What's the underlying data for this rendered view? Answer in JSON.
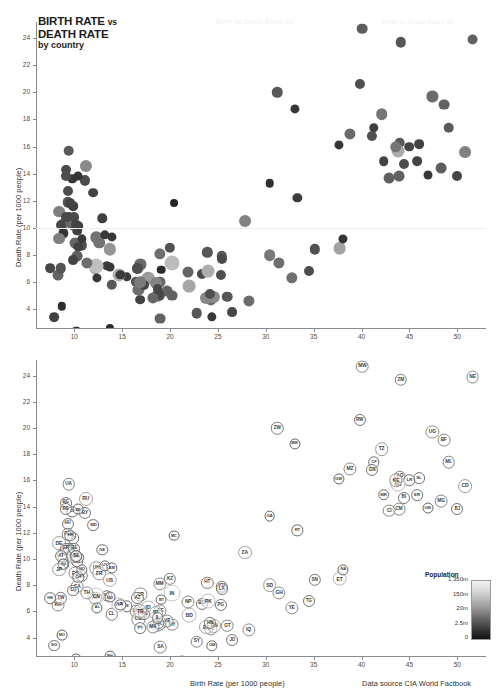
{
  "page": {
    "watermark": "Birth vs Death Rates v3"
  },
  "title": {
    "line1_main": "BIRTH RATE",
    "line1_sub": "vs",
    "line2": "DEATH RATE",
    "line3": "by country"
  },
  "source_note": "Data source CIA World Factbook",
  "axes": {
    "x_label": "Birth Rate (per 1000 people)",
    "y_label": "Death Rate (per 1000 people)",
    "x_ticks": [
      10,
      15,
      20,
      25,
      30,
      35,
      40,
      45,
      50
    ],
    "y_ticks": [
      4,
      6,
      8,
      10,
      12,
      14,
      16,
      18,
      20,
      22,
      24
    ],
    "xlim": [
      6,
      53
    ],
    "ylim": [
      2.6,
      25.2
    ]
  },
  "legend": {
    "title": "Population",
    "ticks": [
      "1,350m",
      "150m",
      "20m",
      "2.5m",
      "0"
    ]
  },
  "colors": {
    "bubble_dark": "#2b2b2b",
    "bubble_mid": "#6e6e6e",
    "bubble_light": "#bfbfbf",
    "axis": "#8a8a8a",
    "grid": "#eceff1"
  },
  "chart_data": {
    "type": "scatter",
    "xlabel": "Birth Rate (per 1000 people)",
    "ylabel": "Death Rate (per 1000 people)",
    "xlim": [
      6,
      53
    ],
    "ylim": [
      2.6,
      25.2
    ],
    "grid": false,
    "legend_position": "bottom-right",
    "size_encodes": "Population",
    "color_encodes": "Population",
    "panels": [
      {
        "name": "top-panel",
        "labels": false
      },
      {
        "name": "bottom-panel",
        "labels": true
      }
    ],
    "points": [
      {
        "code": "UA",
        "x": 9.4,
        "y": 15.7,
        "pop": 2.0
      },
      {
        "code": "RU",
        "x": 11.2,
        "y": 14.6,
        "pop": 3.6
      },
      {
        "code": "BG",
        "x": 9.1,
        "y": 14.3,
        "pop": 1.4
      },
      {
        "code": "LV",
        "x": 9.8,
        "y": 13.6,
        "pop": 1.0
      },
      {
        "code": "LT",
        "x": 9.9,
        "y": 11.6,
        "pop": 1.2
      },
      {
        "code": "BY",
        "x": 11.1,
        "y": 13.5,
        "pop": 1.6
      },
      {
        "code": "HU",
        "x": 9.3,
        "y": 12.7,
        "pop": 1.5
      },
      {
        "code": "RO",
        "x": 9.3,
        "y": 11.9,
        "pop": 1.9
      },
      {
        "code": "EE",
        "x": 10.4,
        "y": 13.8,
        "pop": 0.8
      },
      {
        "code": "RS",
        "x": 9.1,
        "y": 13.8,
        "pop": 1.6
      },
      {
        "code": "GE",
        "x": 12.9,
        "y": 10.7,
        "pop": 1.1
      },
      {
        "code": "MD",
        "x": 12.0,
        "y": 12.6,
        "pop": 1.3
      },
      {
        "code": "HR",
        "x": 9.6,
        "y": 11.8,
        "pop": 1.2
      },
      {
        "code": "BA",
        "x": 8.9,
        "y": 9.6,
        "pop": 1.1
      },
      {
        "code": "DE",
        "x": 8.4,
        "y": 11.2,
        "pop": 3.3
      },
      {
        "code": "IT",
        "x": 8.9,
        "y": 10.3,
        "pop": 3.0
      },
      {
        "code": "PT",
        "x": 9.4,
        "y": 10.8,
        "pop": 1.6
      },
      {
        "code": "GR",
        "x": 9.1,
        "y": 10.8,
        "pop": 1.6
      },
      {
        "code": "AT",
        "x": 8.6,
        "y": 10.2,
        "pop": 1.4
      },
      {
        "code": "CZ",
        "x": 9.8,
        "y": 10.3,
        "pop": 1.5
      },
      {
        "code": "SI",
        "x": 8.8,
        "y": 9.6,
        "pop": 0.8
      },
      {
        "code": "SK",
        "x": 10.3,
        "y": 9.8,
        "pop": 1.2
      },
      {
        "code": "PL",
        "x": 9.9,
        "y": 10.2,
        "pop": 2.5
      },
      {
        "code": "FI",
        "x": 10.4,
        "y": 10.1,
        "pop": 1.2
      },
      {
        "code": "BE",
        "x": 10.0,
        "y": 10.8,
        "pop": 1.4
      },
      {
        "code": "DK",
        "x": 10.2,
        "y": 10.2,
        "pop": 1.1
      },
      {
        "code": "SE",
        "x": 10.2,
        "y": 10.2,
        "pop": 1.4
      },
      {
        "code": "UK",
        "x": 12.3,
        "y": 9.3,
        "pop": 2.8
      },
      {
        "code": "FR",
        "x": 12.6,
        "y": 8.9,
        "pop": 2.9
      },
      {
        "code": "NL",
        "x": 10.8,
        "y": 8.7,
        "pop": 1.8
      },
      {
        "code": "ES",
        "x": 10.1,
        "y": 8.9,
        "pop": 2.4
      },
      {
        "code": "CH",
        "x": 10.4,
        "y": 8.6,
        "pop": 1.1
      },
      {
        "code": "NO",
        "x": 10.8,
        "y": 9.2,
        "pop": 1.0
      },
      {
        "code": "IE",
        "x": 15.5,
        "y": 6.4,
        "pop": 1.0
      },
      {
        "code": "US",
        "x": 13.7,
        "y": 8.4,
        "pop": 3.9
      },
      {
        "code": "CA",
        "x": 10.3,
        "y": 7.9,
        "pop": 2.2
      },
      {
        "code": "AU",
        "x": 12.2,
        "y": 7.0,
        "pop": 1.9
      },
      {
        "code": "NZ",
        "x": 13.4,
        "y": 7.2,
        "pop": 1.1
      },
      {
        "code": "JP",
        "x": 8.4,
        "y": 9.2,
        "pop": 3.3
      },
      {
        "code": "KR",
        "x": 8.3,
        "y": 6.5,
        "pop": 2.4
      },
      {
        "code": "TW",
        "x": 8.6,
        "y": 7.0,
        "pop": 1.9
      },
      {
        "code": "SG",
        "x": 7.9,
        "y": 3.4,
        "pop": 1.3
      },
      {
        "code": "HK",
        "x": 7.5,
        "y": 7.0,
        "pop": 1.3
      },
      {
        "code": "MO",
        "x": 8.7,
        "y": 4.2,
        "pop": 0.5
      },
      {
        "code": "CN",
        "x": 12.3,
        "y": 7.2,
        "pop": 8.0
      },
      {
        "code": "TH",
        "x": 11.3,
        "y": 7.4,
        "pop": 2.6
      },
      {
        "code": "CU",
        "x": 9.9,
        "y": 7.6,
        "pop": 1.4
      },
      {
        "code": "UY",
        "x": 13.2,
        "y": 9.5,
        "pop": 1.0
      },
      {
        "code": "CL",
        "x": 13.9,
        "y": 5.8,
        "pop": 1.9
      },
      {
        "code": "AR",
        "x": 16.9,
        "y": 7.3,
        "pop": 2.6
      },
      {
        "code": "BR",
        "x": 14.7,
        "y": 6.5,
        "pop": 5.0
      },
      {
        "code": "KZ",
        "x": 20.0,
        "y": 8.5,
        "pop": 1.8
      },
      {
        "code": "MC",
        "x": 20.4,
        "y": 11.8,
        "pop": 0.3
      },
      {
        "code": "MU",
        "x": 13.7,
        "y": 7.1,
        "pop": 0.8
      },
      {
        "code": "LK",
        "x": 16.4,
        "y": 6.0,
        "pop": 1.8
      },
      {
        "code": "VN",
        "x": 17.0,
        "y": 5.9,
        "pop": 3.0
      },
      {
        "code": "MY",
        "x": 20.2,
        "y": 5.0,
        "pop": 2.2
      },
      {
        "code": "ID",
        "x": 17.7,
        "y": 6.3,
        "pop": 4.3
      },
      {
        "code": "IN",
        "x": 20.2,
        "y": 7.4,
        "pop": 8.0
      },
      {
        "code": "MX",
        "x": 18.6,
        "y": 5.0,
        "pop": 3.6
      },
      {
        "code": "CO",
        "x": 16.7,
        "y": 5.4,
        "pop": 2.6
      },
      {
        "code": "PE",
        "x": 19.0,
        "y": 6.0,
        "pop": 2.4
      },
      {
        "code": "VE",
        "x": 19.7,
        "y": 5.3,
        "pop": 2.3
      },
      {
        "code": "EC",
        "x": 18.9,
        "y": 5.0,
        "pop": 1.9
      },
      {
        "code": "BO",
        "x": 23.3,
        "y": 6.6,
        "pop": 1.6
      },
      {
        "code": "PY",
        "x": 16.9,
        "y": 4.7,
        "pop": 1.3
      },
      {
        "code": "NI",
        "x": 18.8,
        "y": 5.1,
        "pop": 1.4
      },
      {
        "code": "AL",
        "x": 12.4,
        "y": 6.3,
        "pop": 0.9
      },
      {
        "code": "TN",
        "x": 17.3,
        "y": 5.8,
        "pop": 1.5
      },
      {
        "code": "DZ",
        "x": 24.3,
        "y": 4.7,
        "pop": 2.6
      },
      {
        "code": "MA",
        "x": 18.2,
        "y": 4.8,
        "pop": 2.5
      },
      {
        "code": "TR",
        "x": 16.9,
        "y": 6.0,
        "pop": 3.2
      },
      {
        "code": "IR",
        "x": 18.5,
        "y": 5.9,
        "pop": 3.4
      },
      {
        "code": "AZ",
        "x": 16.6,
        "y": 7.0,
        "pop": 1.6
      },
      {
        "code": "AM",
        "x": 13.9,
        "y": 9.3,
        "pop": 0.9
      },
      {
        "code": "EG",
        "x": 23.8,
        "y": 4.8,
        "pop": 3.6
      },
      {
        "code": "SA",
        "x": 19.0,
        "y": 3.3,
        "pop": 2.2
      },
      {
        "code": "JO",
        "x": 26.5,
        "y": 3.8,
        "pop": 1.4
      },
      {
        "code": "AE",
        "x": 15.4,
        "y": 2.0,
        "pop": 1.2
      },
      {
        "code": "KW",
        "x": 21.2,
        "y": 2.2,
        "pop": 0.8
      },
      {
        "code": "QA",
        "x": 10.2,
        "y": 2.4,
        "pop": 0.5
      },
      {
        "code": "OM",
        "x": 24.4,
        "y": 3.4,
        "pop": 1.0
      },
      {
        "code": "BH",
        "x": 13.7,
        "y": 2.6,
        "pop": 0.4
      },
      {
        "code": "IL",
        "x": 18.7,
        "y": 5.5,
        "pop": 1.4
      },
      {
        "code": "SY",
        "x": 22.8,
        "y": 3.7,
        "pop": 2.0
      },
      {
        "code": "LB",
        "x": 14.8,
        "y": 6.5,
        "pop": 1.0
      },
      {
        "code": "IQ",
        "x": 28.2,
        "y": 4.6,
        "pop": 2.6
      },
      {
        "code": "PK",
        "x": 24.0,
        "y": 6.8,
        "pop": 4.7
      },
      {
        "code": "BD",
        "x": 22.0,
        "y": 5.7,
        "pop": 4.5
      },
      {
        "code": "NP",
        "x": 21.9,
        "y": 6.7,
        "pop": 2.4
      },
      {
        "code": "MM",
        "x": 18.9,
        "y": 8.1,
        "pop": 2.7
      },
      {
        "code": "PH",
        "x": 24.6,
        "y": 4.9,
        "pop": 3.6
      },
      {
        "code": "KH",
        "x": 25.4,
        "y": 7.9,
        "pop": 1.9
      },
      {
        "code": "LA",
        "x": 25.4,
        "y": 7.7,
        "pop": 1.5
      },
      {
        "code": "PG",
        "x": 25.3,
        "y": 6.5,
        "pop": 1.6
      },
      {
        "code": "BT",
        "x": 19.1,
        "y": 6.9,
        "pop": 0.6
      },
      {
        "code": "HT",
        "x": 23.9,
        "y": 8.2,
        "pop": 1.8
      },
      {
        "code": "GT",
        "x": 26.0,
        "y": 4.9,
        "pop": 2.0
      },
      {
        "code": "HN",
        "x": 24.2,
        "y": 5.1,
        "pop": 1.6
      },
      {
        "code": "YE",
        "x": 32.7,
        "y": 6.3,
        "pop": 2.7
      },
      {
        "code": "SD",
        "x": 30.4,
        "y": 8.0,
        "pop": 3.1
      },
      {
        "code": "GH",
        "x": 31.4,
        "y": 7.4,
        "pop": 2.6
      },
      {
        "code": "TG",
        "x": 34.5,
        "y": 6.8,
        "pop": 1.5
      },
      {
        "code": "SN",
        "x": 35.1,
        "y": 8.4,
        "pop": 1.8
      },
      {
        "code": "ET",
        "x": 37.7,
        "y": 8.5,
        "pop": 4.4
      },
      {
        "code": "NA",
        "x": 38.1,
        "y": 9.2,
        "pop": 0.9
      },
      {
        "code": "MW",
        "x": 40.1,
        "y": 24.7,
        "pop": 2.1
      },
      {
        "code": "ZM",
        "x": 44.1,
        "y": 23.7,
        "pop": 1.9
      },
      {
        "code": "NE",
        "x": 51.6,
        "y": 23.9,
        "pop": 2.3
      },
      {
        "code": "ZW",
        "x": 31.2,
        "y": 20.0,
        "pop": 1.9
      },
      {
        "code": "BW",
        "x": 33.0,
        "y": 18.8,
        "pop": 0.9
      },
      {
        "code": "RW",
        "x": 39.8,
        "y": 20.6,
        "pop": 1.6
      },
      {
        "code": "UG",
        "x": 47.4,
        "y": 19.7,
        "pop": 2.6
      },
      {
        "code": "BF",
        "x": 48.6,
        "y": 19.1,
        "pop": 2.2
      },
      {
        "code": "TZ",
        "x": 42.1,
        "y": 18.4,
        "pop": 3.0
      },
      {
        "code": "ML",
        "x": 49.1,
        "y": 17.4,
        "pop": 2.0
      },
      {
        "code": "CF",
        "x": 41.3,
        "y": 17.4,
        "pop": 1.1
      },
      {
        "code": "CD",
        "x": 50.8,
        "y": 15.6,
        "pop": 3.3
      },
      {
        "code": "MZ",
        "x": 38.8,
        "y": 16.9,
        "pop": 2.5
      },
      {
        "code": "GW",
        "x": 37.6,
        "y": 16.1,
        "pop": 0.9
      },
      {
        "code": "AO",
        "x": 44.0,
        "y": 16.3,
        "pop": 2.0
      },
      {
        "code": "SL",
        "x": 46.0,
        "y": 16.2,
        "pop": 1.3
      },
      {
        "code": "LR",
        "x": 45.0,
        "y": 16.0,
        "pop": 1.2
      },
      {
        "code": "NG",
        "x": 43.8,
        "y": 15.7,
        "pop": 4.8
      },
      {
        "code": "GN",
        "x": 41.1,
        "y": 16.8,
        "pop": 1.6
      },
      {
        "code": "KE",
        "x": 43.6,
        "y": 16.0,
        "pop": 2.9
      },
      {
        "code": "MR",
        "x": 42.3,
        "y": 14.9,
        "pop": 1.2
      },
      {
        "code": "BI",
        "x": 44.4,
        "y": 14.7,
        "pop": 1.5
      },
      {
        "code": "ER",
        "x": 45.8,
        "y": 14.9,
        "pop": 1.3
      },
      {
        "code": "MG",
        "x": 48.3,
        "y": 14.4,
        "pop": 2.2
      },
      {
        "code": "BJ",
        "x": 50.0,
        "y": 13.8,
        "pop": 1.5
      },
      {
        "code": "GM",
        "x": 46.9,
        "y": 13.9,
        "pop": 0.8
      },
      {
        "code": "CM",
        "x": 43.9,
        "y": 13.8,
        "pop": 2.2
      },
      {
        "code": "CI",
        "x": 42.9,
        "y": 13.7,
        "pop": 2.2
      },
      {
        "code": "GA",
        "x": 30.4,
        "y": 13.3,
        "pop": 0.6
      },
      {
        "code": "RT",
        "x": 33.3,
        "y": 12.2,
        "pop": 1.0
      },
      {
        "code": "ZA",
        "x": 27.8,
        "y": 10.5,
        "pop": 3.4
      }
    ]
  }
}
